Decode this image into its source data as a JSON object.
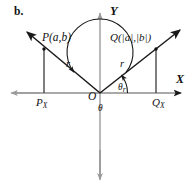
{
  "figure": {
    "panel_label": "b.",
    "axes": {
      "y_label": "Y",
      "x_label": "X",
      "origin_label": "O"
    },
    "points": {
      "p_label": "P(a,b)",
      "q_label": "Q(|a|,|b|)",
      "p_foot_label": "P",
      "p_foot_sub": "X",
      "q_foot_label": "Q",
      "q_foot_sub": "X"
    },
    "segments": {
      "radius_left_label": "r",
      "radius_right_label": "r"
    },
    "angles": {
      "theta_label": "θ",
      "reference_label": "θ",
      "reference_sub": "r"
    },
    "colors": {
      "ink": "#121212",
      "axis": "#6e6e6e",
      "axis_light": "#9a9a9a",
      "background": "#ffffff"
    },
    "icons": {
      "y_axis_arrow": "arrow-up-icon",
      "x_axis_arrow": "arrow-right-icon",
      "ray_arrow": "arrow-ray-icon",
      "arc_arrow": "arc-arrowhead-icon"
    }
  }
}
